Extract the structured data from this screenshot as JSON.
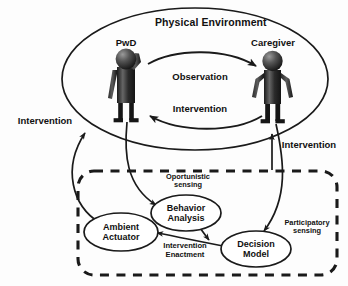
{
  "diagram": {
    "title": "Physical Environment",
    "environment": {
      "label": "Physical Environment",
      "shape": "ellipse"
    },
    "actors": [
      {
        "id": "pwd",
        "label": "PwD",
        "icon": "person-confused-icon"
      },
      {
        "id": "caregiver",
        "label": "Caregiver",
        "icon": "person-standing-icon"
      }
    ],
    "environment_flows": [
      {
        "id": "observation",
        "label": "Observation",
        "from": "pwd",
        "to": "caregiver"
      },
      {
        "id": "intervention_inner",
        "label": "Intervention",
        "from": "caregiver",
        "to": "pwd"
      }
    ],
    "outer_flows": [
      {
        "id": "intervention_left",
        "label": "Intervention"
      },
      {
        "id": "intervention_right",
        "label": "Intervention"
      }
    ],
    "system_box": {
      "style": "dashed-rounded-rectangle",
      "nodes": [
        {
          "id": "ambient_actuator",
          "line1": "Ambient",
          "line2": "Actuator"
        },
        {
          "id": "behavior_analysis",
          "line1": "Behavior",
          "line2": "Analysis"
        },
        {
          "id": "decision_model",
          "line1": "Decision",
          "line2": "Model"
        }
      ],
      "edges": [
        {
          "id": "oportunistic_sensing",
          "line1": "Oportunistic",
          "line2": "sensing",
          "from": "pwd",
          "to": "behavior_analysis"
        },
        {
          "id": "participatory_sensing",
          "line1": "Participatory",
          "line2": "sensing",
          "from": "caregiver",
          "to": "decision_model"
        },
        {
          "id": "intervention_enactment",
          "line1": "Intervention",
          "line2": "Enactment",
          "from": "decision_model",
          "to": "ambient_actuator"
        },
        {
          "id": "behavior_to_decision",
          "line1": "",
          "line2": "",
          "from": "behavior_analysis",
          "to": "decision_model"
        }
      ]
    },
    "colors": {
      "stroke": "#1a1a1a",
      "figure_dark": "#1c1c1c",
      "figure_mid": "#4a4a4a",
      "figure_light": "#8e8e8e",
      "background": "#fdfdfd",
      "text": "#111111"
    }
  }
}
